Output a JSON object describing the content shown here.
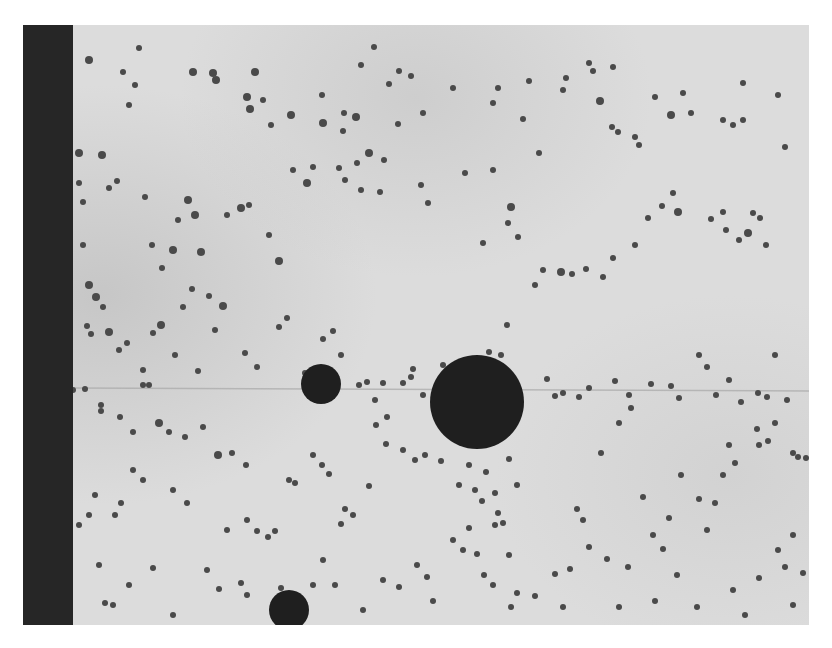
{
  "image": {
    "kind": "grayscale micrograph",
    "frame": {
      "x": 23,
      "y": 25,
      "width": 786,
      "height": 600
    },
    "colors": {
      "background": "#ffffff",
      "field_light": "#dcdcdc",
      "field_mid": "#cfcfcf",
      "field_shadow": "#bdbdbd",
      "edge_strip": "#262626",
      "particle": "#4a4a4a",
      "sphere": "#1f1f1f",
      "scratch_line": "#a8a8a8"
    },
    "edge_strip": {
      "x": 0,
      "width": 50
    },
    "scratch_line_y": 363,
    "large_spheres": [
      {
        "cx": 298,
        "cy": 359,
        "r": 20
      },
      {
        "cx": 454,
        "cy": 377,
        "r": 47
      },
      {
        "cx": 266,
        "cy": 585,
        "r": 20
      }
    ],
    "particles": [
      [
        66,
        35,
        4
      ],
      [
        116,
        23,
        3
      ],
      [
        170,
        47,
        4
      ],
      [
        100,
        47,
        3
      ],
      [
        106,
        80,
        3
      ],
      [
        112,
        60,
        3
      ],
      [
        190,
        48,
        4
      ],
      [
        193,
        55,
        4
      ],
      [
        232,
        47,
        4
      ],
      [
        224,
        72,
        4
      ],
      [
        227,
        84,
        4
      ],
      [
        240,
        75,
        3
      ],
      [
        248,
        100,
        3
      ],
      [
        268,
        90,
        4
      ],
      [
        299,
        70,
        3
      ],
      [
        321,
        88,
        3
      ],
      [
        300,
        98,
        4
      ],
      [
        320,
        106,
        3
      ],
      [
        333,
        92,
        4
      ],
      [
        338,
        40,
        3
      ],
      [
        351,
        22,
        3
      ],
      [
        366,
        59,
        3
      ],
      [
        376,
        46,
        3
      ],
      [
        388,
        51,
        3
      ],
      [
        400,
        88,
        3
      ],
      [
        430,
        63,
        3
      ],
      [
        470,
        78,
        3
      ],
      [
        475,
        63,
        3
      ],
      [
        500,
        94,
        3
      ],
      [
        506,
        56,
        3
      ],
      [
        540,
        65,
        3
      ],
      [
        543,
        53,
        3
      ],
      [
        566,
        38,
        3
      ],
      [
        570,
        46,
        3
      ],
      [
        577,
        76,
        4
      ],
      [
        590,
        42,
        3
      ],
      [
        589,
        102,
        3
      ],
      [
        595,
        107,
        3
      ],
      [
        612,
        112,
        3
      ],
      [
        616,
        120,
        3
      ],
      [
        632,
        72,
        3
      ],
      [
        648,
        90,
        4
      ],
      [
        660,
        68,
        3
      ],
      [
        668,
        88,
        3
      ],
      [
        700,
        95,
        3
      ],
      [
        710,
        100,
        3
      ],
      [
        720,
        58,
        3
      ],
      [
        720,
        95,
        3
      ],
      [
        755,
        70,
        3
      ],
      [
        762,
        122,
        3
      ],
      [
        56,
        128,
        4
      ],
      [
        56,
        158,
        3
      ],
      [
        60,
        177,
        3
      ],
      [
        79,
        130,
        4
      ],
      [
        86,
        163,
        3
      ],
      [
        94,
        156,
        3
      ],
      [
        122,
        172,
        3
      ],
      [
        129,
        220,
        3
      ],
      [
        139,
        243,
        3
      ],
      [
        150,
        225,
        4
      ],
      [
        155,
        195,
        3
      ],
      [
        165,
        175,
        4
      ],
      [
        172,
        190,
        4
      ],
      [
        178,
        227,
        4
      ],
      [
        204,
        190,
        3
      ],
      [
        218,
        183,
        4
      ],
      [
        226,
        180,
        3
      ],
      [
        246,
        210,
        3
      ],
      [
        256,
        236,
        4
      ],
      [
        270,
        145,
        3
      ],
      [
        284,
        158,
        4
      ],
      [
        290,
        142,
        3
      ],
      [
        316,
        143,
        3
      ],
      [
        322,
        155,
        3
      ],
      [
        334,
        138,
        3
      ],
      [
        338,
        165,
        3
      ],
      [
        346,
        128,
        4
      ],
      [
        357,
        167,
        3
      ],
      [
        361,
        135,
        3
      ],
      [
        375,
        99,
        3
      ],
      [
        398,
        160,
        3
      ],
      [
        405,
        178,
        3
      ],
      [
        442,
        148,
        3
      ],
      [
        460,
        218,
        3
      ],
      [
        470,
        145,
        3
      ],
      [
        488,
        182,
        4
      ],
      [
        485,
        198,
        3
      ],
      [
        495,
        212,
        3
      ],
      [
        516,
        128,
        3
      ],
      [
        520,
        245,
        3
      ],
      [
        538,
        247,
        4
      ],
      [
        549,
        249,
        3
      ],
      [
        563,
        244,
        3
      ],
      [
        580,
        252,
        3
      ],
      [
        590,
        233,
        3
      ],
      [
        612,
        220,
        3
      ],
      [
        625,
        193,
        3
      ],
      [
        639,
        181,
        3
      ],
      [
        650,
        168,
        3
      ],
      [
        655,
        187,
        4
      ],
      [
        688,
        194,
        3
      ],
      [
        700,
        187,
        3
      ],
      [
        703,
        205,
        3
      ],
      [
        716,
        215,
        3
      ],
      [
        725,
        208,
        4
      ],
      [
        730,
        188,
        3
      ],
      [
        737,
        193,
        3
      ],
      [
        743,
        220,
        3
      ],
      [
        60,
        220,
        3
      ],
      [
        66,
        260,
        4
      ],
      [
        73,
        272,
        4
      ],
      [
        80,
        282,
        3
      ],
      [
        64,
        301,
        3
      ],
      [
        68,
        309,
        3
      ],
      [
        86,
        307,
        4
      ],
      [
        96,
        325,
        3
      ],
      [
        104,
        318,
        3
      ],
      [
        120,
        345,
        3
      ],
      [
        120,
        360,
        3
      ],
      [
        126,
        360,
        3
      ],
      [
        130,
        308,
        3
      ],
      [
        138,
        300,
        4
      ],
      [
        152,
        330,
        3
      ],
      [
        160,
        282,
        3
      ],
      [
        169,
        264,
        3
      ],
      [
        175,
        346,
        3
      ],
      [
        186,
        271,
        3
      ],
      [
        192,
        305,
        3
      ],
      [
        200,
        281,
        4
      ],
      [
        222,
        328,
        3
      ],
      [
        234,
        342,
        3
      ],
      [
        256,
        302,
        3
      ],
      [
        264,
        293,
        3
      ],
      [
        282,
        348,
        3
      ],
      [
        300,
        314,
        3
      ],
      [
        310,
        306,
        3
      ],
      [
        318,
        330,
        3
      ],
      [
        336,
        360,
        3
      ],
      [
        344,
        357,
        3
      ],
      [
        360,
        358,
        3
      ],
      [
        352,
        375,
        3
      ],
      [
        364,
        392,
        3
      ],
      [
        380,
        358,
        3
      ],
      [
        388,
        352,
        3
      ],
      [
        390,
        344,
        3
      ],
      [
        400,
        370,
        3
      ],
      [
        420,
        340,
        3
      ],
      [
        440,
        342,
        4
      ],
      [
        466,
        327,
        3
      ],
      [
        478,
        330,
        3
      ],
      [
        484,
        300,
        3
      ],
      [
        512,
        260,
        3
      ],
      [
        524,
        354,
        3
      ],
      [
        532,
        371,
        3
      ],
      [
        540,
        368,
        3
      ],
      [
        556,
        372,
        3
      ],
      [
        566,
        363,
        3
      ],
      [
        592,
        356,
        3
      ],
      [
        606,
        370,
        3
      ],
      [
        628,
        359,
        3
      ],
      [
        648,
        361,
        3
      ],
      [
        656,
        373,
        3
      ],
      [
        676,
        330,
        3
      ],
      [
        684,
        342,
        3
      ],
      [
        693,
        370,
        3
      ],
      [
        706,
        355,
        3
      ],
      [
        718,
        377,
        3
      ],
      [
        735,
        368,
        3
      ],
      [
        744,
        372,
        3
      ],
      [
        752,
        330,
        3
      ],
      [
        764,
        375,
        3
      ],
      [
        770,
        428,
        3
      ],
      [
        775,
        432,
        3
      ],
      [
        783,
        433,
        3
      ],
      [
        50,
        365,
        3
      ],
      [
        62,
        364,
        3
      ],
      [
        78,
        380,
        3
      ],
      [
        78,
        386,
        3
      ],
      [
        97,
        392,
        3
      ],
      [
        110,
        407,
        3
      ],
      [
        136,
        398,
        4
      ],
      [
        146,
        407,
        3
      ],
      [
        162,
        412,
        3
      ],
      [
        180,
        402,
        3
      ],
      [
        195,
        430,
        4
      ],
      [
        209,
        428,
        3
      ],
      [
        223,
        440,
        3
      ],
      [
        224,
        495,
        3
      ],
      [
        234,
        506,
        3
      ],
      [
        245,
        512,
        3
      ],
      [
        252,
        506,
        3
      ],
      [
        266,
        455,
        3
      ],
      [
        272,
        458,
        3
      ],
      [
        290,
        430,
        3
      ],
      [
        299,
        440,
        3
      ],
      [
        306,
        449,
        3
      ],
      [
        318,
        499,
        3
      ],
      [
        322,
        484,
        3
      ],
      [
        330,
        490,
        3
      ],
      [
        346,
        461,
        3
      ],
      [
        353,
        400,
        3
      ],
      [
        363,
        419,
        3
      ],
      [
        380,
        425,
        3
      ],
      [
        392,
        435,
        3
      ],
      [
        402,
        430,
        3
      ],
      [
        418,
        436,
        3
      ],
      [
        436,
        460,
        3
      ],
      [
        446,
        440,
        3
      ],
      [
        452,
        465,
        3
      ],
      [
        459,
        476,
        3
      ],
      [
        463,
        447,
        3
      ],
      [
        472,
        468,
        3
      ],
      [
        475,
        488,
        3
      ],
      [
        472,
        500,
        3
      ],
      [
        480,
        498,
        3
      ],
      [
        486,
        434,
        3
      ],
      [
        494,
        460,
        3
      ],
      [
        486,
        530,
        3
      ],
      [
        430,
        515,
        3
      ],
      [
        440,
        525,
        3
      ],
      [
        446,
        503,
        3
      ],
      [
        454,
        529,
        3
      ],
      [
        461,
        550,
        3
      ],
      [
        470,
        560,
        3
      ],
      [
        488,
        582,
        3
      ],
      [
        494,
        568,
        3
      ],
      [
        512,
        571,
        3
      ],
      [
        532,
        549,
        3
      ],
      [
        547,
        544,
        3
      ],
      [
        554,
        484,
        3
      ],
      [
        560,
        495,
        3
      ],
      [
        578,
        428,
        3
      ],
      [
        596,
        398,
        3
      ],
      [
        608,
        383,
        3
      ],
      [
        620,
        472,
        3
      ],
      [
        630,
        510,
        3
      ],
      [
        646,
        493,
        3
      ],
      [
        658,
        450,
        3
      ],
      [
        676,
        474,
        3
      ],
      [
        684,
        505,
        3
      ],
      [
        692,
        478,
        3
      ],
      [
        700,
        450,
        3
      ],
      [
        706,
        420,
        3
      ],
      [
        712,
        438,
        3
      ],
      [
        734,
        404,
        3
      ],
      [
        736,
        420,
        3
      ],
      [
        745,
        416,
        3
      ],
      [
        752,
        398,
        3
      ],
      [
        755,
        525,
        3
      ],
      [
        762,
        542,
        3
      ],
      [
        770,
        510,
        3
      ],
      [
        780,
        548,
        3
      ],
      [
        710,
        565,
        3
      ],
      [
        736,
        553,
        3
      ],
      [
        654,
        550,
        3
      ],
      [
        640,
        524,
        3
      ],
      [
        605,
        542,
        3
      ],
      [
        584,
        534,
        3
      ],
      [
        566,
        522,
        3
      ],
      [
        540,
        582,
        3
      ],
      [
        596,
        582,
        3
      ],
      [
        632,
        576,
        3
      ],
      [
        674,
        582,
        3
      ],
      [
        722,
        590,
        3
      ],
      [
        770,
        580,
        3
      ],
      [
        82,
        578,
        3
      ],
      [
        90,
        580,
        3
      ],
      [
        150,
        590,
        3
      ],
      [
        106,
        560,
        3
      ],
      [
        130,
        543,
        3
      ],
      [
        76,
        540,
        3
      ],
      [
        56,
        500,
        3
      ],
      [
        66,
        490,
        3
      ],
      [
        72,
        470,
        3
      ],
      [
        92,
        490,
        3
      ],
      [
        110,
        445,
        3
      ],
      [
        120,
        455,
        3
      ],
      [
        98,
        478,
        3
      ],
      [
        150,
        465,
        3
      ],
      [
        164,
        478,
        3
      ],
      [
        184,
        545,
        3
      ],
      [
        196,
        564,
        3
      ],
      [
        204,
        505,
        3
      ],
      [
        218,
        558,
        3
      ],
      [
        224,
        570,
        3
      ],
      [
        258,
        563,
        3
      ],
      [
        312,
        560,
        3
      ],
      [
        340,
        585,
        3
      ],
      [
        360,
        555,
        3
      ],
      [
        376,
        562,
        3
      ],
      [
        394,
        540,
        3
      ],
      [
        404,
        552,
        3
      ],
      [
        410,
        576,
        3
      ],
      [
        300,
        535,
        3
      ],
      [
        290,
        560,
        3
      ]
    ]
  }
}
